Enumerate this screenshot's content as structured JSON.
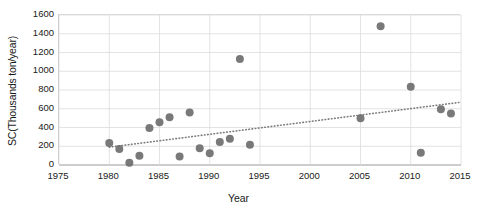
{
  "chart_data": {
    "type": "scatter",
    "title": "",
    "xlabel": "Year",
    "ylabel": "SC(Thousands ton/year)",
    "xlim": [
      1975,
      2015
    ],
    "ylim": [
      0,
      1600
    ],
    "xticks": [
      1975,
      1980,
      1985,
      1990,
      1995,
      2000,
      2005,
      2010,
      2015
    ],
    "yticks": [
      0,
      200,
      400,
      600,
      800,
      1000,
      1200,
      1400,
      1600
    ],
    "grid": true,
    "legend": "none",
    "marker_color": "#6e6e6e",
    "trendline_color": "#7b7b7b",
    "trendline_style": "dotted",
    "series": [
      {
        "name": "SC",
        "points": [
          {
            "x": 1980,
            "y": 235
          },
          {
            "x": 1981,
            "y": 170
          },
          {
            "x": 1982,
            "y": 25
          },
          {
            "x": 1983,
            "y": 100
          },
          {
            "x": 1984,
            "y": 395
          },
          {
            "x": 1985,
            "y": 455
          },
          {
            "x": 1986,
            "y": 510
          },
          {
            "x": 1987,
            "y": 90
          },
          {
            "x": 1988,
            "y": 560
          },
          {
            "x": 1989,
            "y": 180
          },
          {
            "x": 1990,
            "y": 125
          },
          {
            "x": 1991,
            "y": 245
          },
          {
            "x": 1992,
            "y": 280
          },
          {
            "x": 1993,
            "y": 1130
          },
          {
            "x": 1994,
            "y": 215
          },
          {
            "x": 2005,
            "y": 500
          },
          {
            "x": 2007,
            "y": 1480
          },
          {
            "x": 2010,
            "y": 835
          },
          {
            "x": 2011,
            "y": 130
          },
          {
            "x": 2013,
            "y": 595
          },
          {
            "x": 2014,
            "y": 550
          }
        ]
      }
    ],
    "trendline": {
      "x_start": 1980,
      "y_start": 190,
      "x_end": 2015,
      "y_end": 670
    }
  }
}
